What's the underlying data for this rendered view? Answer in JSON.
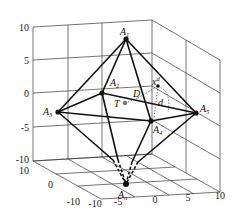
{
  "figure": {
    "type": "3D polytope (octahedron) in coordinate box",
    "z_ticks": [
      "10",
      "5",
      "0",
      "-5",
      "-10"
    ],
    "y_ticks": [
      "10",
      "0",
      "-10"
    ],
    "x_ticks": [
      "-10",
      "-5",
      "0",
      "5",
      "10"
    ],
    "vertices": [
      {
        "name": "A",
        "sub": "1"
      },
      {
        "name": "A",
        "sub": "2"
      },
      {
        "name": "A",
        "sub": "3"
      },
      {
        "name": "A",
        "sub": "4"
      },
      {
        "name": "A",
        "sub": "5"
      },
      {
        "name": "A",
        "sub": "n"
      }
    ],
    "points": {
      "T": "T",
      "D": "D",
      "xd_base": "x",
      "xd_sup": "d",
      "d": "d"
    }
  }
}
